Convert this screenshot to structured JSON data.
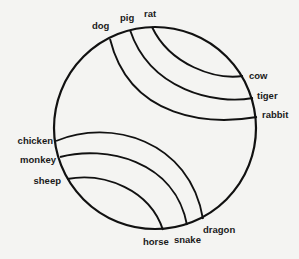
{
  "diagram": {
    "type": "chord-circle",
    "circle": {
      "cx": 155,
      "cy": 128,
      "r": 101,
      "stroke": "#111111",
      "stroke_width": 2.2
    },
    "labels": [
      {
        "id": "dog",
        "text": "dog",
        "x": 92,
        "y": 29,
        "anchor": "start"
      },
      {
        "id": "pig",
        "text": "pig",
        "x": 120,
        "y": 21,
        "anchor": "start"
      },
      {
        "id": "rat",
        "text": "rat",
        "x": 144,
        "y": 17,
        "anchor": "start"
      },
      {
        "id": "cow",
        "text": "cow",
        "x": 249,
        "y": 79,
        "anchor": "start"
      },
      {
        "id": "tiger",
        "text": "tiger",
        "x": 257,
        "y": 99,
        "anchor": "start"
      },
      {
        "id": "rabbit",
        "text": "rabbit",
        "x": 262,
        "y": 118,
        "anchor": "start"
      },
      {
        "id": "chicken",
        "text": "chicken",
        "x": 53,
        "y": 144,
        "anchor": "end"
      },
      {
        "id": "monkey",
        "text": "monkey",
        "x": 56,
        "y": 163,
        "anchor": "end"
      },
      {
        "id": "sheep",
        "text": "sheep",
        "x": 61,
        "y": 184,
        "anchor": "end"
      },
      {
        "id": "horse",
        "text": "horse",
        "x": 143,
        "y": 245,
        "anchor": "start"
      },
      {
        "id": "snake",
        "text": "snake",
        "x": 174,
        "y": 243,
        "anchor": "start"
      },
      {
        "id": "dragon",
        "text": "dragon",
        "x": 203,
        "y": 233,
        "anchor": "start"
      }
    ],
    "chords": [
      {
        "from": "dog",
        "to": "rabbit",
        "d": "M110,39 C130,120 210,125 257,117"
      },
      {
        "from": "pig",
        "to": "tiger",
        "d": "M130,30 C150,90 215,105 253,98"
      },
      {
        "from": "rat",
        "to": "cow",
        "d": "M152,27 C170,65 215,80 243,76"
      },
      {
        "from": "chicken",
        "to": "dragon",
        "d": "M56,141 C110,118 190,140 203,219"
      },
      {
        "from": "monkey",
        "to": "snake",
        "d": "M60,157 C105,145 175,160 187,225"
      },
      {
        "from": "sheep",
        "to": "horse",
        "d": "M67,179 C105,172 150,190 163,230"
      }
    ]
  }
}
